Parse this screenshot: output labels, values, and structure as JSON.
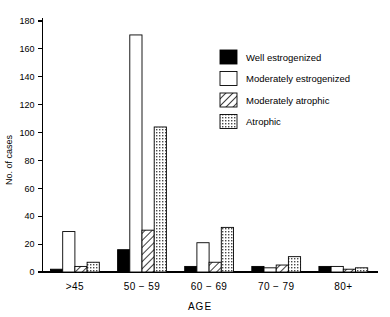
{
  "chart_data": {
    "type": "bar",
    "title": "",
    "xlabel": "AGE",
    "ylabel": "No. of cases",
    "categories": [
      ">45",
      "50 − 59",
      "60 − 69",
      "70 − 79",
      "80+"
    ],
    "ylim": [
      0,
      180
    ],
    "yticks": [
      0,
      20,
      40,
      60,
      80,
      100,
      120,
      140,
      160,
      180
    ],
    "grid": false,
    "legend_position": "upper-right",
    "series": [
      {
        "name": "Well estrogenized",
        "pattern": "solid-black",
        "color": "#000000",
        "values": [
          2,
          16,
          4,
          4,
          4
        ]
      },
      {
        "name": "Moderately estrogenized",
        "pattern": "empty-white",
        "color": "#ffffff",
        "values": [
          29,
          170,
          21,
          3,
          4
        ]
      },
      {
        "name": "Moderately atrophic",
        "pattern": "diagonal-hatch",
        "color": "#ffffff",
        "values": [
          4,
          30,
          7,
          5,
          2
        ]
      },
      {
        "name": "Atrophic",
        "pattern": "dotted-stipple",
        "color": "#ffffff",
        "values": [
          7,
          104,
          32,
          11,
          3
        ]
      }
    ]
  }
}
